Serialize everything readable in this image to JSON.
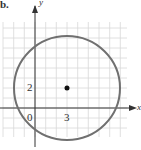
{
  "figure": {
    "part_label": "b.",
    "axis_x": "x",
    "axis_y": "y",
    "origin_label": "0",
    "x_tick_label": "3",
    "y_tick_label": "2"
  },
  "circle": {
    "center": [
      3,
      2
    ],
    "radius": 5
  },
  "colors": {
    "grid": "#d8d8d8",
    "circle": "#707070",
    "axis": "#333333",
    "point": "#111111"
  }
}
